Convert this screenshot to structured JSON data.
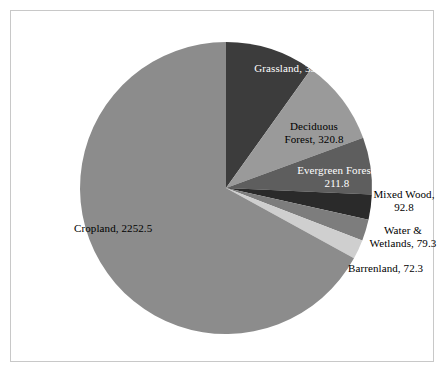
{
  "chart_data": {
    "type": "pie",
    "title": "",
    "subtitle": "",
    "xlabel": "",
    "ylabel": "",
    "legend_position": "none",
    "grid": false,
    "label_format": "name, value",
    "total": 3361.5,
    "start_angle_deg": 0,
    "direction": "clockwise",
    "categories": [
      "Grassland",
      "Deciduous Forest",
      "Evergreen Forest",
      "Mixed Wood",
      "Water & Wetlands",
      "Barrenland",
      "Cropland"
    ],
    "values": [
      332,
      320.8,
      211.8,
      92.8,
      79.3,
      72.3,
      2252.5
    ],
    "colors": [
      "#3c3c3c",
      "#9a9a9a",
      "#5e5e5e",
      "#2a2a2a",
      "#7d7d7d",
      "#cfcfcf",
      "#8c8c8c"
    ],
    "slices": [
      {
        "name": "Grassland",
        "value": 332,
        "label": "Grassland, 332",
        "color": "#3c3c3c",
        "label_color": "light",
        "label_inside": true
      },
      {
        "name": "Deciduous Forest",
        "value": 320.8,
        "label_line1": "Deciduous",
        "label_line2": "Forest, 320.8",
        "label": "Deciduous Forest, 320.8",
        "color": "#9a9a9a",
        "label_color": "dark",
        "label_inside": true
      },
      {
        "name": "Evergreen Forest",
        "value": 211.8,
        "label_line1": "Evergreen Forest,",
        "label_line2": "211.8",
        "label": "Evergreen Forest, 211.8",
        "color": "#5e5e5e",
        "label_color": "light",
        "label_inside": true
      },
      {
        "name": "Mixed Wood",
        "value": 92.8,
        "label_line1": "Mixed Wood,",
        "label_line2": "92.8",
        "label": "Mixed Wood, 92.8",
        "color": "#2a2a2a",
        "label_color": "dark",
        "label_inside": false
      },
      {
        "name": "Water & Wetlands",
        "value": 79.3,
        "label_line1": "Water &",
        "label_line2": "Wetlands, 79.3",
        "label": "Water & Wetlands, 79.3",
        "color": "#7d7d7d",
        "label_color": "dark",
        "label_inside": false
      },
      {
        "name": "Barrenland",
        "value": 72.3,
        "label": "Barrenland, 72.3",
        "color": "#cfcfcf",
        "label_color": "dark",
        "label_inside": false
      },
      {
        "name": "Cropland",
        "value": 2252.5,
        "label": "Cropland, 2252.5",
        "color": "#8c8c8c",
        "label_color": "dark",
        "label_inside": true
      }
    ]
  },
  "geometry": {
    "center_x": 226,
    "center_y": 188,
    "radius": 146
  }
}
